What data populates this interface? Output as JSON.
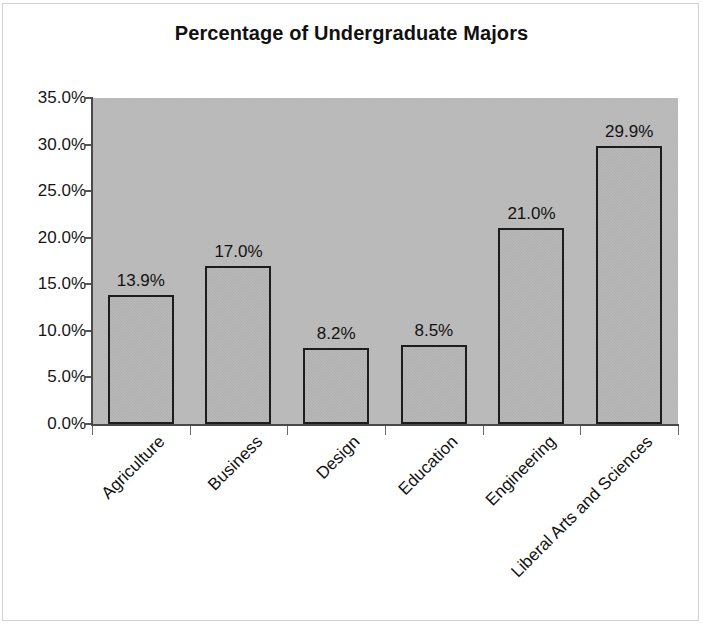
{
  "chart_data": {
    "type": "bar",
    "title": "Percentage of Undergraduate Majors",
    "xlabel": "",
    "ylabel": "",
    "categories": [
      "Agriculture",
      "Business",
      "Design",
      "Education",
      "Engineering",
      "Liberal Arts and Sciences"
    ],
    "values": [
      13.9,
      17.0,
      8.2,
      8.5,
      21.0,
      29.9
    ],
    "data_labels": [
      "13.9%",
      "17.0%",
      "8.2%",
      "8.5%",
      "21.0%",
      "29.9%"
    ],
    "ylim": [
      0,
      35
    ],
    "ytick_values": [
      0,
      5,
      10,
      15,
      20,
      25,
      30,
      35
    ],
    "ytick_labels": [
      "0.0%",
      "5.0%",
      "10.0%",
      "15.0%",
      "20.0%",
      "25.0%",
      "30.0%",
      "35.0%"
    ],
    "grid": false,
    "legend": null,
    "legend_position": "none",
    "plot_background_color": "#b7b7b7",
    "bar_fill_color": "#adadad",
    "bar_border_color": "#1d1d1d",
    "axis_color": "#4a4a4a",
    "text_color": "#121212",
    "page_background_color": "#ffffff"
  }
}
